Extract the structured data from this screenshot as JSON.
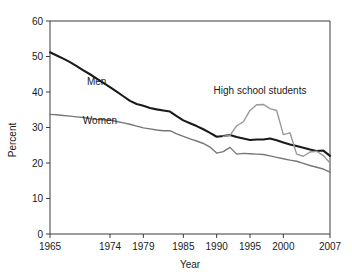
{
  "chart_data": {
    "type": "line",
    "title": "",
    "xlabel": "Year",
    "ylabel": "Percent",
    "xlim": [
      1965,
      2007
    ],
    "ylim": [
      0,
      60
    ],
    "grid": false,
    "legend_position": "inline-annotations",
    "yticks": [
      0,
      10,
      20,
      30,
      40,
      50,
      60
    ],
    "xticks": [
      1965,
      1974,
      1979,
      1985,
      1990,
      1995,
      2000,
      2007
    ],
    "ytick_labels": [
      "0",
      "10",
      "20",
      "30",
      "40",
      "50",
      "60"
    ],
    "xtick_labels": [
      "1965",
      "1974",
      "1979",
      "1985",
      "1990",
      "1995",
      "2000",
      "2007"
    ],
    "series": [
      {
        "name": "Men",
        "color": "#1a1a1a",
        "width": 2.1,
        "label_x": 1972.0,
        "label_y": 42.0,
        "x": [
          1965,
          1966,
          1967,
          1968,
          1969,
          1970,
          1971,
          1972,
          1973,
          1974,
          1975,
          1976,
          1977,
          1978,
          1979,
          1980,
          1981,
          1982,
          1983,
          1984,
          1985,
          1986,
          1987,
          1988,
          1989,
          1990,
          1991,
          1992,
          1993,
          1994,
          1995,
          1996,
          1997,
          1998,
          1999,
          2000,
          2001,
          2002,
          2003,
          2004,
          2005,
          2006,
          2007
        ],
        "values": [
          51.2,
          50.3,
          49.4,
          48.4,
          47.3,
          46.1,
          45.0,
          43.8,
          42.6,
          41.4,
          40.1,
          38.8,
          37.5,
          36.6,
          36.1,
          35.5,
          35.1,
          34.8,
          34.5,
          33.2,
          32.0,
          31.2,
          30.4,
          29.5,
          28.5,
          27.4,
          27.6,
          27.9,
          27.3,
          26.9,
          26.5,
          26.6,
          26.6,
          26.9,
          26.4,
          25.8,
          25.2,
          24.8,
          24.3,
          23.8,
          23.4,
          23.5,
          22.0
        ]
      },
      {
        "name": "Women",
        "color": "#777777",
        "width": 1.4,
        "label_x": 1972.5,
        "label_y": 31.0,
        "x": [
          1965,
          1966,
          1967,
          1968,
          1969,
          1970,
          1971,
          1972,
          1973,
          1974,
          1975,
          1976,
          1977,
          1978,
          1979,
          1980,
          1981,
          1982,
          1983,
          1984,
          1985,
          1986,
          1987,
          1988,
          1989,
          1990,
          1991,
          1992,
          1993,
          1994,
          1995,
          1996,
          1997,
          1998,
          1999,
          2000,
          2001,
          2002,
          2003,
          2004,
          2005,
          2006,
          2007
        ],
        "values": [
          33.7,
          33.6,
          33.4,
          33.2,
          33.0,
          32.8,
          32.5,
          32.3,
          32.2,
          32.1,
          31.7,
          31.3,
          30.9,
          30.4,
          29.9,
          29.6,
          29.3,
          29.1,
          29.1,
          28.2,
          27.5,
          26.8,
          26.2,
          25.5,
          24.5,
          22.8,
          23.2,
          24.4,
          22.5,
          22.7,
          22.6,
          22.5,
          22.4,
          22.0,
          21.6,
          21.2,
          20.8,
          20.5,
          19.9,
          19.3,
          18.8,
          18.3,
          17.4
        ]
      },
      {
        "name": "High school students",
        "color": "#9a9a9a",
        "width": 1.4,
        "label_x": 1996.5,
        "label_y": 39.5,
        "x": [
          1991,
          1992,
          1993,
          1994,
          1995,
          1996,
          1997,
          1998,
          1999,
          2000,
          2001,
          2002,
          2003,
          2004,
          2005,
          2006,
          2007
        ],
        "values": [
          27.5,
          27.8,
          30.5,
          31.6,
          34.8,
          36.4,
          36.5,
          35.3,
          34.8,
          28.0,
          28.5,
          22.5,
          21.9,
          23.1,
          23.3,
          22.1,
          20.0
        ]
      }
    ]
  },
  "labels": {
    "men": "Men",
    "women": "Women",
    "high_school": "High school students",
    "x_axis_title": "Year",
    "y_axis_title": "Percent"
  }
}
